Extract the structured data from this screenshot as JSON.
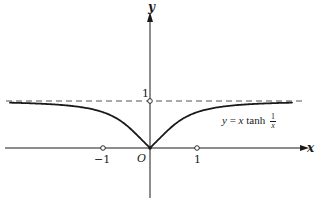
{
  "figure": {
    "colors": {
      "ink": "#1a1a1a",
      "background": "#ffffff"
    }
  },
  "axes": {
    "x_label": "x",
    "y_label": "y",
    "origin_label": "O",
    "x_ticks": [
      {
        "value": -1,
        "label": "−1"
      },
      {
        "value": 1,
        "label": "1"
      }
    ],
    "y_ticks": [
      {
        "value": 1,
        "label": "1"
      }
    ]
  },
  "curve": {
    "equation_lhs": "y = ",
    "equation_var": "x",
    "equation_fn": " tanh ",
    "equation_frac_num": "1",
    "equation_frac_den": "x"
  },
  "asymptote": {
    "value": 1,
    "style": "dashed"
  },
  "chart_data": {
    "type": "line",
    "title": "",
    "xlabel": "x",
    "ylabel": "y",
    "xlim": [
      -3.0,
      3.4
    ],
    "ylim": [
      -1.1,
      2.9
    ],
    "grid": false,
    "legend": "none",
    "series": [
      {
        "name": "y = x tanh(1/x)",
        "style": "solid",
        "x": [
          -3.0,
          -2.5,
          -2.0,
          -1.5,
          -1.0,
          -0.75,
          -0.5,
          -0.25,
          0,
          0.25,
          0.5,
          0.75,
          1.0,
          1.5,
          2.0,
          2.5,
          3.0
        ],
        "y": [
          0.963,
          0.948,
          0.924,
          0.874,
          0.762,
          0.654,
          0.482,
          0.25,
          0,
          0.25,
          0.482,
          0.654,
          0.762,
          0.874,
          0.924,
          0.948,
          0.963
        ]
      },
      {
        "name": "asymptote y = 1",
        "style": "dashed",
        "x": [
          -3.1,
          3.2
        ],
        "y": [
          1,
          1
        ]
      }
    ],
    "annotations": [
      {
        "text": "y = x tanh 1/x",
        "x": 1.6,
        "y": 0.6
      },
      {
        "text": "O",
        "x": -0.1,
        "y": -0.15
      },
      {
        "text": "open circle",
        "x": -1,
        "y": 0
      },
      {
        "text": "open circle",
        "x": 1,
        "y": 0
      },
      {
        "text": "open circle",
        "x": 0,
        "y": 1
      }
    ]
  }
}
